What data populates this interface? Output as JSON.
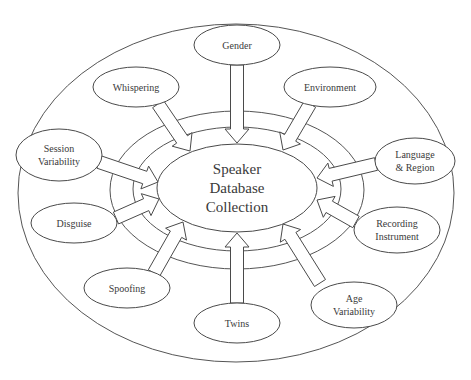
{
  "diagram": {
    "center": {
      "lines": [
        "Speaker",
        "Database",
        "Collection"
      ],
      "cx": 237,
      "cy": 188,
      "rx": 80,
      "ry": 44
    },
    "outer_ellipse": {
      "cx": 236,
      "cy": 193,
      "rx": 218,
      "ry": 169
    },
    "rings": [
      {
        "cx": 237,
        "cy": 190,
        "rx": 127,
        "ry": 79
      },
      {
        "cx": 237,
        "cy": 189,
        "rx": 104,
        "ry": 62
      }
    ],
    "nodes": [
      {
        "id": "gender",
        "lines": [
          "Gender"
        ],
        "cx": 237,
        "cy": 45,
        "rx": 43,
        "ry": 20
      },
      {
        "id": "environment",
        "lines": [
          "Environment"
        ],
        "cx": 330,
        "cy": 87,
        "rx": 46,
        "ry": 20
      },
      {
        "id": "language-region",
        "lines": [
          "Language",
          "& Region"
        ],
        "cx": 415,
        "cy": 161,
        "rx": 40,
        "ry": 23
      },
      {
        "id": "recording-instrument",
        "lines": [
          "Recording",
          "Instrument"
        ],
        "cx": 397,
        "cy": 230,
        "rx": 43,
        "ry": 23
      },
      {
        "id": "age-variability",
        "lines": [
          "Age",
          "Variability"
        ],
        "cx": 354,
        "cy": 305,
        "rx": 43,
        "ry": 23
      },
      {
        "id": "twins",
        "lines": [
          "Twins"
        ],
        "cx": 237,
        "cy": 323,
        "rx": 43,
        "ry": 20
      },
      {
        "id": "spoofing",
        "lines": [
          "Spoofing"
        ],
        "cx": 127,
        "cy": 288,
        "rx": 43,
        "ry": 20
      },
      {
        "id": "disguise",
        "lines": [
          "Disguise"
        ],
        "cx": 74,
        "cy": 223,
        "rx": 43,
        "ry": 20
      },
      {
        "id": "session-variability",
        "lines": [
          "Session",
          "Variability"
        ],
        "cx": 59,
        "cy": 155,
        "rx": 43,
        "ry": 26
      },
      {
        "id": "whispering",
        "lines": [
          "Whispering"
        ],
        "cx": 136,
        "cy": 87,
        "rx": 43,
        "ry": 20
      }
    ],
    "arrows": [
      {
        "from": "gender",
        "x1": 237,
        "y1": 65,
        "x2": 237,
        "y2": 143
      },
      {
        "from": "environment",
        "x1": 310,
        "y1": 104,
        "x2": 283,
        "y2": 150
      },
      {
        "from": "language-region",
        "x1": 376,
        "y1": 164,
        "x2": 317,
        "y2": 178
      },
      {
        "from": "recording-instrument",
        "x1": 356,
        "y1": 222,
        "x2": 317,
        "y2": 200
      },
      {
        "from": "age-variability",
        "x1": 320,
        "y1": 283,
        "x2": 283,
        "y2": 224
      },
      {
        "from": "twins",
        "x1": 237,
        "y1": 303,
        "x2": 237,
        "y2": 233
      },
      {
        "from": "spoofing",
        "x1": 154,
        "y1": 273,
        "x2": 183,
        "y2": 222
      },
      {
        "from": "disguise",
        "x1": 116,
        "y1": 218,
        "x2": 159,
        "y2": 199
      },
      {
        "from": "session-variability",
        "x1": 99,
        "y1": 162,
        "x2": 158,
        "y2": 182
      },
      {
        "from": "whispering",
        "x1": 158,
        "y1": 104,
        "x2": 190,
        "y2": 151
      }
    ]
  }
}
